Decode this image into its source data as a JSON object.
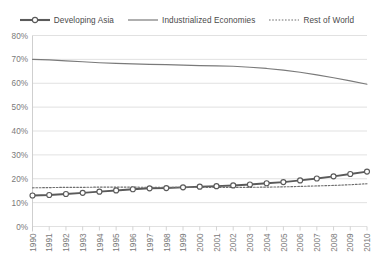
{
  "chart_data": {
    "type": "line",
    "title": "",
    "xlabel": "",
    "ylabel": "",
    "ylim": [
      0,
      80
    ],
    "grid": true,
    "legend_position": "top",
    "categories": [
      "1990",
      "1991",
      "1992",
      "1993",
      "1994",
      "1995",
      "1996",
      "1997",
      "1998",
      "1999",
      "2000",
      "2001",
      "2002",
      "2003",
      "2004",
      "2005",
      "2006",
      "2007",
      "2008",
      "2009",
      "2010"
    ],
    "ytick_labels": [
      "80%",
      "70%",
      "60%",
      "50%",
      "40%",
      "30%",
      "20%",
      "10%",
      "0%"
    ],
    "ytick_values": [
      80,
      70,
      60,
      50,
      40,
      30,
      20,
      10,
      0
    ],
    "series": [
      {
        "name": "Developing Asia",
        "style": "thick-marker",
        "color": "#5a5a5a",
        "marker": "open-circle",
        "values": [
          13.0,
          13.2,
          13.6,
          14.1,
          14.6,
          15.1,
          15.6,
          16.0,
          16.1,
          16.4,
          16.7,
          16.9,
          17.2,
          17.6,
          18.1,
          18.6,
          19.3,
          20.1,
          21.0,
          22.0,
          23.0
        ]
      },
      {
        "name": "Industrialized Economies",
        "style": "solid",
        "color": "#7a7a7a",
        "marker": "none",
        "values": [
          70.0,
          69.8,
          69.4,
          69.0,
          68.6,
          68.3,
          68.1,
          67.9,
          67.8,
          67.6,
          67.4,
          67.3,
          67.1,
          66.7,
          66.2,
          65.5,
          64.6,
          63.5,
          62.3,
          61.0,
          59.6
        ]
      },
      {
        "name": "Rest of World",
        "style": "dotted",
        "color": "#6e6e6e",
        "marker": "none",
        "values": [
          16.2,
          16.3,
          16.4,
          16.4,
          16.5,
          16.5,
          16.5,
          16.4,
          16.4,
          16.4,
          16.4,
          16.4,
          16.4,
          16.4,
          16.5,
          16.6,
          16.8,
          17.0,
          17.2,
          17.5,
          17.9
        ]
      }
    ]
  },
  "legend": {
    "items": [
      {
        "label": "Developing Asia"
      },
      {
        "label": "Industrialized Economies"
      },
      {
        "label": "Rest of World"
      }
    ]
  },
  "colors": {
    "gridline": "#d9d9d9",
    "axis": "#c9c9c9",
    "text": "#7a7a7a",
    "background": "#ffffff"
  }
}
